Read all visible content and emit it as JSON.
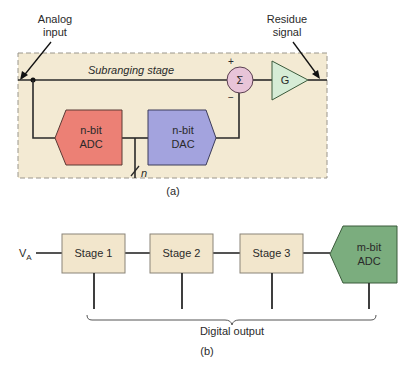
{
  "figure_a": {
    "analog_input_label_line1": "Analog",
    "analog_input_label_line2": "input",
    "residue_label_line1": "Residue",
    "residue_label_line2": "signal",
    "stage_title": "Subranging stage",
    "summer_symbol": "Σ",
    "summer_plus": "+",
    "summer_minus": "−",
    "gain_label": "G",
    "adc_line1": "n-bit",
    "adc_line2": "ADC",
    "dac_line1": "n-bit",
    "dac_line2": "DAC",
    "bus_width_label": "n",
    "caption": "(a)"
  },
  "figure_b": {
    "input_label": "V",
    "input_subscript": "A",
    "stages": [
      {
        "label": "Stage 1"
      },
      {
        "label": "Stage 2"
      },
      {
        "label": "Stage 3"
      }
    ],
    "final_adc_line1": "m-bit",
    "final_adc_line2": "ADC",
    "output_label": "Digital output",
    "caption": "(b)"
  },
  "colors": {
    "stage_box_bg": "#f3ead3",
    "stage_box_border": "#a09a8a",
    "adc_red": "#ec8075",
    "dac_blue": "#a3a3de",
    "summer_pink": "#e8c4d8",
    "gain_green": "#d6ecd6",
    "final_adc_green": "#7bad7e",
    "stage_block_bg": "#f2e6cc",
    "wire": "#2a2a2a"
  }
}
